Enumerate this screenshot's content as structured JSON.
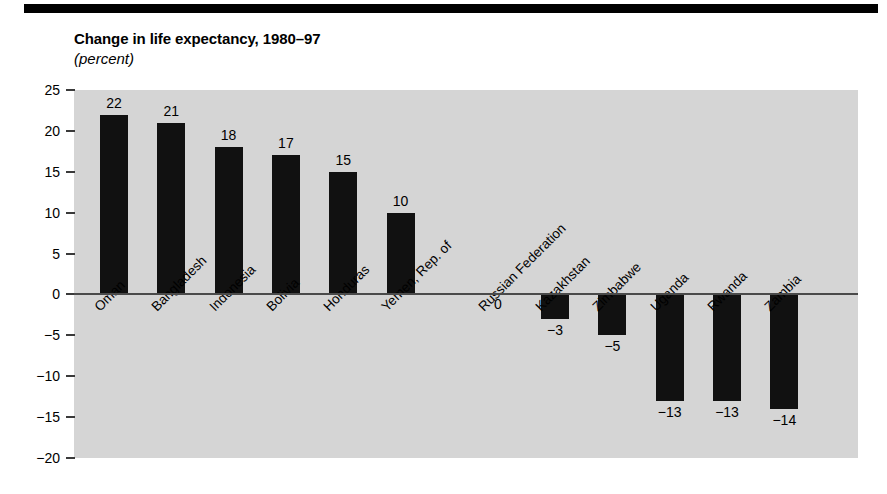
{
  "figure": {
    "title": "Change in life expectancy, 1980–97",
    "subtitle": "(percent)"
  },
  "chart_data": {
    "type": "bar",
    "title": "Change in life expectancy, 1980–97",
    "subtitle": "(percent)",
    "xlabel": "",
    "ylabel": "",
    "ylim": [
      -20,
      25
    ],
    "yticks": [
      25,
      20,
      15,
      10,
      5,
      0,
      -5,
      -10,
      -15,
      -20
    ],
    "ytick_labels": [
      "25",
      "20",
      "15",
      "10",
      "5",
      "0",
      "−5",
      "−10",
      "−15",
      "−20"
    ],
    "grid": false,
    "legend": null,
    "orientation": "vertical",
    "bar_color": "#111111",
    "plot_background": "#d5d5d5",
    "categories": [
      "Oman",
      "Bangladesh",
      "Indonesia",
      "Bolivia",
      "Honduras",
      "Yemen, Rep. of",
      "Russian Federation",
      "Kazakhstan",
      "Zimbabwe",
      "Uganda",
      "Rwanda",
      "Zambia"
    ],
    "values": [
      22,
      21,
      18,
      17,
      15,
      10,
      0,
      -3,
      -5,
      -13,
      -13,
      -14
    ],
    "value_labels": [
      "22",
      "21",
      "18",
      "17",
      "15",
      "10",
      "0",
      "−3",
      "−5",
      "−13",
      "−13",
      "−14"
    ],
    "gap_after_index": 5
  }
}
